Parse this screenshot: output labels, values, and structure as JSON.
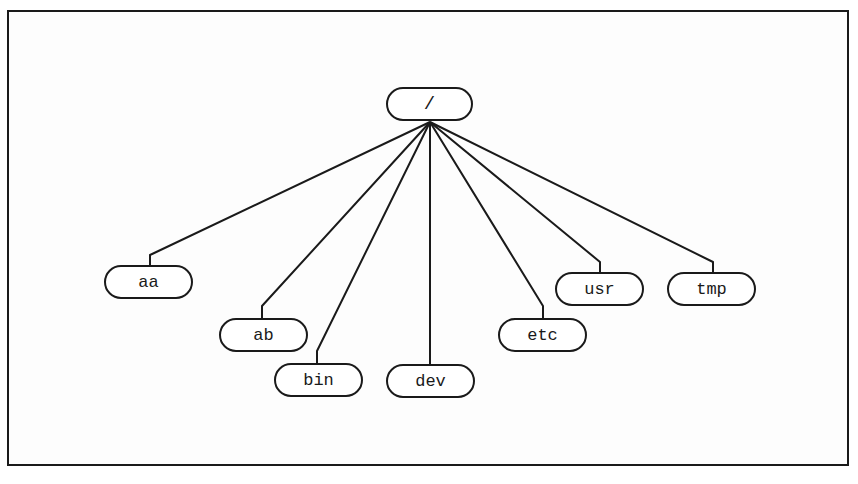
{
  "diagram": {
    "type": "directory-tree",
    "root": {
      "label": "/"
    },
    "children": [
      {
        "id": "aa",
        "label": "aa"
      },
      {
        "id": "ab",
        "label": "ab"
      },
      {
        "id": "bin",
        "label": "bin"
      },
      {
        "id": "dev",
        "label": "dev"
      },
      {
        "id": "etc",
        "label": "etc"
      },
      {
        "id": "usr",
        "label": "usr"
      },
      {
        "id": "tmp",
        "label": "tmp"
      }
    ],
    "edges": [
      [
        "/",
        "aa"
      ],
      [
        "/",
        "ab"
      ],
      [
        "/",
        "bin"
      ],
      [
        "/",
        "dev"
      ],
      [
        "/",
        "etc"
      ],
      [
        "/",
        "usr"
      ],
      [
        "/",
        "tmp"
      ]
    ],
    "colors": {
      "stroke": "#1a1a1a",
      "background": "#ffffff"
    }
  }
}
